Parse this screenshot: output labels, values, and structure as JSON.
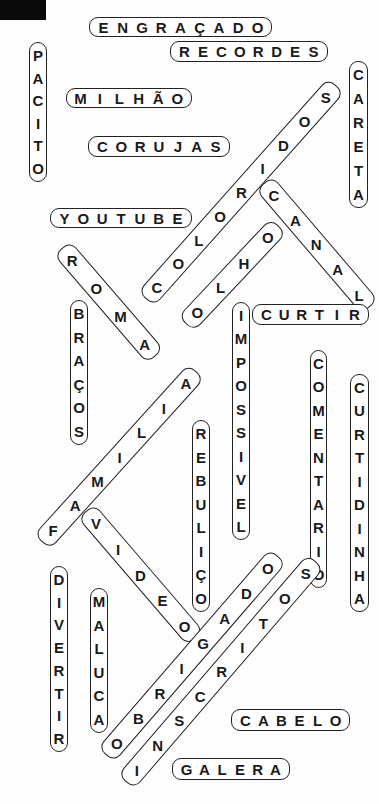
{
  "puzzle": {
    "type": "word-search-solved",
    "corner_block": {
      "color": "#0a0a0a"
    },
    "words": [
      {
        "id": "engracado",
        "text": "ENGRAÇADO",
        "dir": "h",
        "x": 89,
        "y": 17,
        "w": 183,
        "h": 20
      },
      {
        "id": "recordes",
        "text": "RECORDES",
        "dir": "h",
        "x": 170,
        "y": 41,
        "w": 158,
        "h": 21
      },
      {
        "id": "pacito",
        "text": "PACITO",
        "dir": "v",
        "x": 29,
        "y": 42,
        "w": 18,
        "h": 140
      },
      {
        "id": "careta",
        "text": "CARETA",
        "dir": "v",
        "x": 349,
        "y": 61,
        "w": 19,
        "h": 147
      },
      {
        "id": "milhao",
        "text": "MILHÃO",
        "dir": "h",
        "x": 66,
        "y": 88,
        "w": 126,
        "h": 20
      },
      {
        "id": "corujas",
        "text": "CORUJAS",
        "dir": "h",
        "x": 88,
        "y": 136,
        "w": 142,
        "h": 21
      },
      {
        "id": "youtube",
        "text": "YOUTUBE",
        "dir": "h",
        "x": 50,
        "y": 208,
        "w": 142,
        "h": 20
      },
      {
        "id": "coloridos",
        "text": "COLORIDOS",
        "dir": "d",
        "x1": 152,
        "y1": 292,
        "x2": 330,
        "y2": 92
      },
      {
        "id": "canal",
        "text": "CANAL",
        "dir": "d",
        "x1": 270,
        "y1": 190,
        "x2": 364,
        "y2": 300
      },
      {
        "id": "olho",
        "text": "OLHO",
        "dir": "d",
        "x1": 192,
        "y1": 317,
        "x2": 272,
        "y2": 232
      },
      {
        "id": "roma",
        "text": "ROMA",
        "dir": "d",
        "x1": 68,
        "y1": 255,
        "x2": 150,
        "y2": 350
      },
      {
        "id": "curtir",
        "text": "CURTIR",
        "dir": "h",
        "x": 252,
        "y": 304,
        "w": 117,
        "h": 21
      },
      {
        "id": "bracos",
        "text": "BRAÇOS",
        "dir": "v",
        "x": 70,
        "y": 300,
        "w": 18,
        "h": 145
      },
      {
        "id": "impossivel",
        "text": "IMPOSSIVEL",
        "dir": "v",
        "x": 232,
        "y": 302,
        "w": 18,
        "h": 238
      },
      {
        "id": "comentario",
        "text": "COMENTARIO",
        "dir": "v",
        "x": 310,
        "y": 350,
        "w": 17,
        "h": 238
      },
      {
        "id": "curtidinha",
        "text": "CURTIDINHA",
        "dir": "v",
        "x": 350,
        "y": 374,
        "w": 19,
        "h": 238
      },
      {
        "id": "rebulico",
        "text": "REBULIÇO",
        "dir": "v",
        "x": 192,
        "y": 420,
        "w": 18,
        "h": 192
      },
      {
        "id": "familia",
        "text": "FAMILIA",
        "dir": "d",
        "x1": 48,
        "y1": 535,
        "x2": 190,
        "y2": 378
      },
      {
        "id": "video",
        "text": "VIDEO",
        "dir": "d",
        "x1": 92,
        "y1": 518,
        "x2": 190,
        "y2": 632
      },
      {
        "id": "divertir",
        "text": "DIVERTIR",
        "dir": "v",
        "x": 50,
        "y": 566,
        "w": 18,
        "h": 186
      },
      {
        "id": "maluca",
        "text": "MALUCA",
        "dir": "v",
        "x": 90,
        "y": 588,
        "w": 18,
        "h": 145
      },
      {
        "id": "obrigado",
        "text": "OBRIGADO",
        "dir": "d",
        "x1": 112,
        "y1": 748,
        "x2": 272,
        "y2": 563
      },
      {
        "id": "inscritos",
        "text": "INSCRITOS",
        "dir": "d",
        "x1": 132,
        "y1": 775,
        "x2": 310,
        "y2": 568
      },
      {
        "id": "cabelo",
        "text": "CABELO",
        "dir": "h",
        "x": 231,
        "y": 709,
        "w": 119,
        "h": 22
      },
      {
        "id": "galera",
        "text": "GALERA",
        "dir": "h",
        "x": 172,
        "y": 758,
        "w": 118,
        "h": 22
      }
    ]
  }
}
